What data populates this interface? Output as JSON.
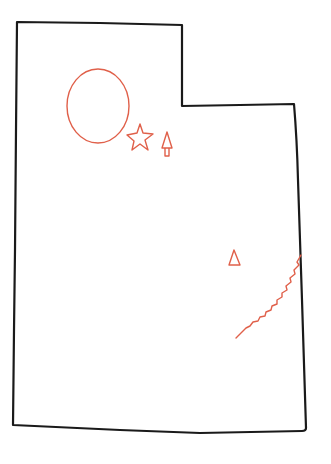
{
  "map": {
    "subject": "Utah state outline (hand-drawn)",
    "colors": {
      "outline": "#1a1a1a",
      "features": "#e0604a",
      "background": "#ffffff"
    },
    "outline_points": [
      [
        17,
        22
      ],
      [
        182,
        25
      ],
      [
        182,
        106
      ],
      [
        294,
        104
      ],
      [
        298,
        180
      ],
      [
        302,
        300
      ],
      [
        306,
        430
      ],
      [
        150,
        432
      ],
      [
        13,
        425
      ],
      [
        15,
        250
      ],
      [
        17,
        22
      ]
    ],
    "features": [
      {
        "name": "great-salt-lake",
        "shape": "ellipse",
        "cx": 98,
        "cy": 106,
        "rx": 31,
        "ry": 37
      },
      {
        "name": "capital-star",
        "shape": "star",
        "cx": 140,
        "cy": 138,
        "r": 11
      },
      {
        "name": "mountain-tree",
        "shape": "tree",
        "x": 167,
        "y": 145
      },
      {
        "name": "peak-triangle",
        "shape": "triangle",
        "x": 234,
        "y": 258
      },
      {
        "name": "river",
        "shape": "wavy-line",
        "from": [
          301,
          255
        ],
        "to": [
          236,
          338
        ]
      }
    ]
  }
}
